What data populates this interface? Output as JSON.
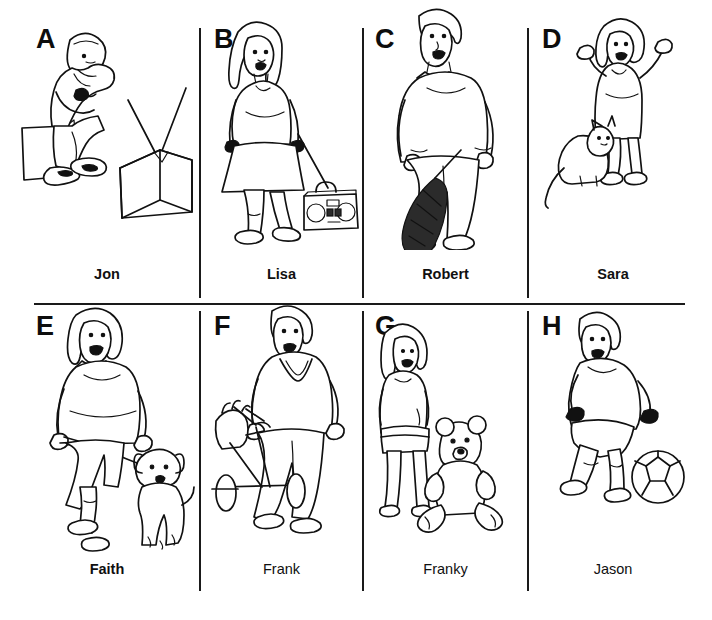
{
  "page": {
    "kind": "picture-card-sheet",
    "rows": 2,
    "columns": 4,
    "background": "#ffffff",
    "ink": "#111111"
  },
  "panels": [
    {
      "letter": "A",
      "name": "Jon",
      "name_bold": true,
      "scene": "boy sitting on a box watching a television set with antenna",
      "figures": [
        "seated-boy",
        "box-seat",
        "television"
      ]
    },
    {
      "letter": "B",
      "name": "Lisa",
      "name_bold": true,
      "scene": "woman standing beside a portable stereo boombox",
      "figures": [
        "standing-woman",
        "boombox"
      ]
    },
    {
      "letter": "C",
      "name": "Robert",
      "name_bold": true,
      "scene": "man standing holding a tennis racquet at his side",
      "figures": [
        "standing-man",
        "tennis-racquet"
      ]
    },
    {
      "letter": "D",
      "name": "Sara",
      "name_bold": true,
      "scene": "little girl with arms raised and a cat in front of her",
      "figures": [
        "girl-arms-up",
        "cat"
      ]
    },
    {
      "letter": "E",
      "name": "Faith",
      "name_bold": true,
      "scene": "woman walking a dog on a leash",
      "figures": [
        "walking-woman",
        "leash",
        "dog"
      ]
    },
    {
      "letter": "F",
      "name": "Frank",
      "name_bold": false,
      "scene": "man pushing a golf bag cart",
      "figures": [
        "standing-man",
        "golf-cart",
        "golf-bag"
      ]
    },
    {
      "letter": "G",
      "name": "Franky",
      "name_bold": false,
      "scene": "girl standing next to a seated teddy bear",
      "figures": [
        "standing-girl",
        "teddy-bear"
      ]
    },
    {
      "letter": "H",
      "name": "Jason",
      "name_bold": false,
      "scene": "boy running and kicking a soccer ball",
      "figures": [
        "running-boy",
        "soccer-ball"
      ]
    }
  ]
}
